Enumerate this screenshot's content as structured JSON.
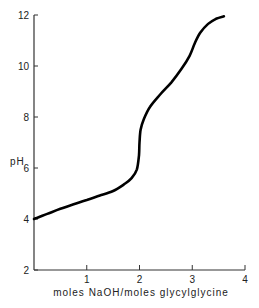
{
  "chart_data": {
    "type": "line",
    "title": "",
    "xlabel": "moles NaOH/moles glycylglycine",
    "ylabel": "pH",
    "xlim": [
      0,
      4
    ],
    "ylim": [
      2,
      12
    ],
    "x_ticks": [
      1,
      2,
      3,
      4
    ],
    "y_ticks": [
      2,
      4,
      6,
      8,
      10,
      12
    ],
    "grid": false,
    "legend": null,
    "series": [
      {
        "name": "titration curve",
        "color": "#000000",
        "points": [
          [
            0.0,
            4.0
          ],
          [
            0.25,
            4.2
          ],
          [
            0.5,
            4.4
          ],
          [
            0.75,
            4.58
          ],
          [
            1.0,
            4.75
          ],
          [
            1.25,
            4.92
          ],
          [
            1.5,
            5.1
          ],
          [
            1.7,
            5.35
          ],
          [
            1.85,
            5.6
          ],
          [
            1.95,
            5.95
          ],
          [
            1.99,
            6.5
          ],
          [
            2.0,
            7.0
          ],
          [
            2.02,
            7.5
          ],
          [
            2.08,
            7.9
          ],
          [
            2.2,
            8.4
          ],
          [
            2.4,
            8.9
          ],
          [
            2.6,
            9.35
          ],
          [
            2.8,
            9.9
          ],
          [
            2.95,
            10.4
          ],
          [
            3.05,
            10.9
          ],
          [
            3.15,
            11.3
          ],
          [
            3.3,
            11.65
          ],
          [
            3.45,
            11.85
          ],
          [
            3.6,
            11.95
          ]
        ]
      }
    ]
  }
}
